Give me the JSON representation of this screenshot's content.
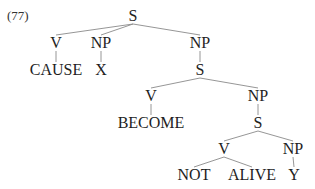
{
  "example": {
    "number": "(77)"
  },
  "tree": {
    "nodes": [
      {
        "id": "s1",
        "label": "S",
        "x": 133,
        "y": 21
      },
      {
        "id": "v1",
        "label": "V",
        "x": 56,
        "y": 48
      },
      {
        "id": "np1",
        "label": "NP",
        "x": 101,
        "y": 48
      },
      {
        "id": "np2",
        "label": "NP",
        "x": 200,
        "y": 48
      },
      {
        "id": "cause",
        "label": "CAUSE",
        "x": 56,
        "y": 75
      },
      {
        "id": "x",
        "label": "X",
        "x": 101,
        "y": 75
      },
      {
        "id": "s2",
        "label": "S",
        "x": 200,
        "y": 75
      },
      {
        "id": "v2",
        "label": "V",
        "x": 151,
        "y": 101
      },
      {
        "id": "np3",
        "label": "NP",
        "x": 258,
        "y": 101
      },
      {
        "id": "become",
        "label": "BECOME",
        "x": 151,
        "y": 128
      },
      {
        "id": "s3",
        "label": "S",
        "x": 258,
        "y": 128
      },
      {
        "id": "v3",
        "label": "V",
        "x": 224,
        "y": 154
      },
      {
        "id": "np4",
        "label": "NP",
        "x": 293,
        "y": 154
      },
      {
        "id": "not",
        "label": "NOT",
        "x": 194,
        "y": 180
      },
      {
        "id": "alive",
        "label": "ALIVE",
        "x": 252,
        "y": 180
      },
      {
        "id": "y",
        "label": "Y",
        "x": 294,
        "y": 180
      }
    ],
    "edges": [
      [
        "s1",
        "v1"
      ],
      [
        "s1",
        "np1"
      ],
      [
        "s1",
        "np2"
      ],
      [
        "v1",
        "cause"
      ],
      [
        "np1",
        "x"
      ],
      [
        "np2",
        "s2"
      ],
      [
        "s2",
        "v2"
      ],
      [
        "s2",
        "np3"
      ],
      [
        "v2",
        "become"
      ],
      [
        "np3",
        "s3"
      ],
      [
        "s3",
        "v3"
      ],
      [
        "s3",
        "np4"
      ],
      [
        "v3",
        "not"
      ],
      [
        "v3",
        "alive"
      ],
      [
        "np4",
        "y"
      ]
    ]
  }
}
